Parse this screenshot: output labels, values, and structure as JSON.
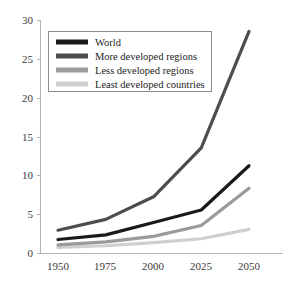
{
  "chart_data": {
    "type": "line",
    "title": "",
    "subtitle": "",
    "xlabel": "",
    "ylabel": "",
    "x": [
      1950,
      1975,
      2000,
      2025,
      2050
    ],
    "xtick_labels": [
      "1950",
      "1975",
      "2000",
      "2025",
      "2050"
    ],
    "ytick_labels": [
      "0",
      "5",
      "10",
      "15",
      "20",
      "25",
      "30"
    ],
    "yticks": [
      0,
      5,
      10,
      15,
      20,
      25,
      30
    ],
    "ylim": [
      0,
      30
    ],
    "xlim": [
      1950,
      2050
    ],
    "grid": false,
    "legend_position": "upper-left-inset",
    "series": [
      {
        "name": "World",
        "color": "#1a1a1a",
        "values": [
          1.8,
          2.4,
          4.0,
          5.6,
          11.3
        ]
      },
      {
        "name": "More developed regions",
        "color": "#4d4d4d",
        "values": [
          3.0,
          4.4,
          7.3,
          13.6,
          28.6
        ]
      },
      {
        "name": "Less developed regions",
        "color": "#9a9a9a",
        "values": [
          1.1,
          1.5,
          2.2,
          3.6,
          8.4
        ]
      },
      {
        "name": "Least developed countries",
        "color": "#cfcfcf",
        "values": [
          0.8,
          1.0,
          1.4,
          1.9,
          3.1
        ]
      }
    ]
  },
  "legend": {
    "entries": [
      {
        "label": "World"
      },
      {
        "label": "More developed regions"
      },
      {
        "label": "Less developed regions"
      },
      {
        "label": "Least developed countries"
      }
    ]
  },
  "axes": {
    "y_labels": [
      "30",
      "25",
      "20",
      "15",
      "10",
      "5",
      "0"
    ],
    "x_labels": [
      "1950",
      "1975",
      "2000",
      "2025",
      "2050"
    ]
  },
  "colors": {
    "axis": "#b3b3b3",
    "text": "#2b2b2b",
    "legend_border": "#8c8c8c",
    "background": "#ffffff"
  }
}
